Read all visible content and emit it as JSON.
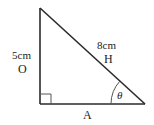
{
  "diagram": {
    "type": "right-triangle",
    "vertices": {
      "top": [
        40,
        8
      ],
      "right_angle": [
        40,
        104
      ],
      "angle_theta": [
        145,
        104
      ]
    },
    "colors": {
      "stroke": "#2a2a2a",
      "text": "#222222",
      "background": "#ffffff"
    },
    "labels": {
      "opposite_length": "5cm",
      "opposite_name": "O",
      "hypotenuse_length": "8cm",
      "hypotenuse_name": "H",
      "adjacent_name": "A",
      "angle": "θ"
    },
    "right_angle_marker": true
  }
}
